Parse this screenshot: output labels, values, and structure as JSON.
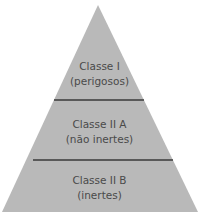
{
  "diagram": {
    "type": "pyramid",
    "fill_color": "#b9b9b9",
    "divider_color": "#3a3a3a",
    "levels": [
      {
        "title": "Classe I",
        "subtitle": "(perigosos)"
      },
      {
        "title": "Classe II A",
        "subtitle": "(não inertes)"
      },
      {
        "title": "Classe II B",
        "subtitle": "(inertes)"
      }
    ]
  }
}
